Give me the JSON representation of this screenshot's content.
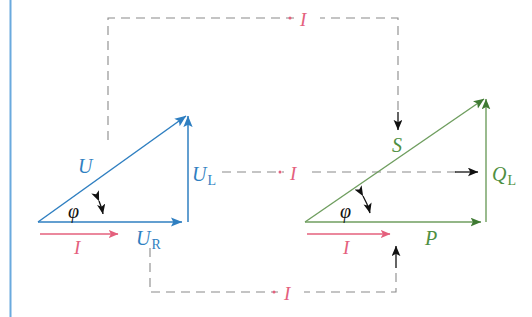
{
  "figure": {
    "colors": {
      "voltage_blue": "#2f7fc1",
      "power_green": "#4f8f42",
      "current_red": "#e4607d",
      "dashed_gray": "#8a8a8a",
      "angle_black": "#1a1a1a",
      "margin_blue": "#6aaade",
      "background": "#ffffff"
    },
    "margin_rule": {
      "name": "left-margin-rule",
      "color": "#6aaade"
    },
    "voltage_triangle": {
      "name": "voltage-triangle",
      "color": "#2f7fc1",
      "hypotenuse_label": "U",
      "vertical_label": "U",
      "vertical_label_sub": "L",
      "horizontal_label": "U",
      "horizontal_label_sub": "R",
      "angle_label": "φ",
      "current_label": "I"
    },
    "power_triangle": {
      "name": "power-triangle",
      "color": "#4f8f42",
      "hypotenuse_label": "S",
      "vertical_label": "Q",
      "vertical_label_sub": "L",
      "horizontal_label": "P",
      "angle_label": "φ",
      "current_label": "I"
    },
    "connectors": [
      {
        "name": "top-connector",
        "label": "I",
        "color": "#e4607d",
        "from": "U (voltage hypotenuse)",
        "to": "S (power hypotenuse)"
      },
      {
        "name": "middle-connector",
        "label": "I",
        "color": "#e4607d",
        "from": "U_L (voltage vertical)",
        "to": "Q_L (power vertical)"
      },
      {
        "name": "bottom-connector",
        "label": "I",
        "color": "#e4607d",
        "from": "U_R (voltage horizontal)",
        "to": "P (power horizontal)"
      }
    ]
  }
}
